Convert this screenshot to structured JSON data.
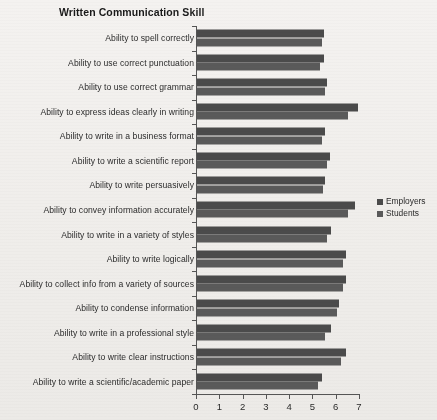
{
  "chart_data": {
    "type": "bar",
    "orientation": "horizontal",
    "title": "Written Communication Skill",
    "xlabel": "",
    "ylabel": "",
    "xlim": [
      0,
      7
    ],
    "xticks": [
      "0",
      "1",
      "2",
      "3",
      "4",
      "5",
      "6",
      "7"
    ],
    "grid": false,
    "legend_position": "right-middle",
    "categories": [
      "Ability to spell correctly",
      "Ability to use correct punctuation",
      "Ability to use correct grammar",
      "Ability to express ideas clearly in writing",
      "Ability to write in a business format",
      "Ability to write a scientific report",
      "Ability to write persuasively",
      "Ability to convey information accurately",
      "Ability to write in a variety of styles",
      "Ability to write logically",
      "Ability to collect info from a variety of sources",
      "Ability to condense information",
      "Ability to write in a professional style",
      "Ability to write clear instructions",
      "Ability to write a scientific/academic paper"
    ],
    "series": [
      {
        "name": "Employers",
        "color": "#4b4b4b",
        "values": [
          5.45,
          5.45,
          5.6,
          6.9,
          5.5,
          5.7,
          5.5,
          6.8,
          5.75,
          6.4,
          6.4,
          6.1,
          5.75,
          6.4,
          5.35
        ]
      },
      {
        "name": "Students",
        "color": "#5a5a5a",
        "values": [
          5.35,
          5.3,
          5.5,
          6.5,
          5.35,
          5.6,
          5.4,
          6.5,
          5.6,
          6.25,
          6.25,
          6.0,
          5.5,
          6.2,
          5.2
        ]
      }
    ]
  },
  "legend": {
    "items": [
      {
        "label": "Employers",
        "color": "#4b4b4b"
      },
      {
        "label": "Students",
        "color": "#5a5a5a"
      }
    ]
  }
}
